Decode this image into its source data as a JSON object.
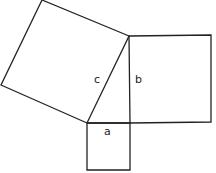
{
  "diagram": {
    "stroke_color": "#222222",
    "labels": {
      "a": "a",
      "b": "b",
      "c": "c"
    },
    "shapes": {
      "square_a": [
        [
          87,
          123
        ],
        [
          130,
          123
        ],
        [
          130,
          170
        ],
        [
          87,
          170
        ]
      ],
      "square_b": [
        [
          129,
          36
        ],
        [
          211,
          35
        ],
        [
          211,
          122
        ],
        [
          130,
          123
        ]
      ],
      "square_c": [
        [
          42,
          0
        ],
        [
          129,
          36
        ],
        [
          87,
          123
        ],
        [
          1,
          85
        ]
      ]
    }
  }
}
